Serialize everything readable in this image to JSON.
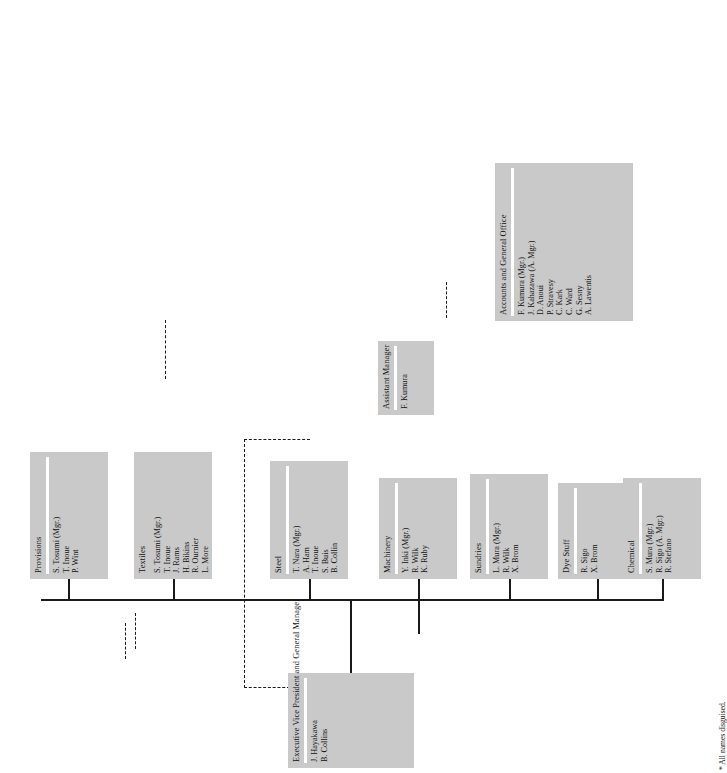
{
  "chart": {
    "type": "org-chart",
    "footnote": "* All names disguised.",
    "accent_color": "#c9c9c9",
    "line_color": "#1a1a1a"
  },
  "executive": {
    "title": "Executive Vice President and General Manager",
    "members": [
      "J. Hayakawa",
      "B. Collins"
    ]
  },
  "assistant": {
    "title": "Assistant Manager",
    "members": [
      "F. Kumura"
    ]
  },
  "accounts": {
    "title": "Accounts and General Office",
    "members": [
      "F. Kumura (Mgr.)",
      "J. Kahazawa (A. Mgr.)",
      "D. Anoui",
      "P. Stravesy",
      "C. Kark",
      "C. Ward",
      "G. Sesny",
      "A. Lawentis"
    ]
  },
  "departments": [
    {
      "name": "Provisions",
      "members": [
        "S. Tosumi (Mgr.)",
        "T. Inoue",
        "P. Wint"
      ]
    },
    {
      "name": "Textiles",
      "members": [
        "S. Tosumi (Mgr.)",
        "T. Inoue",
        "J. Rams",
        "H. Bikins",
        "R. Ournier",
        "L. More"
      ]
    },
    {
      "name": "Steel",
      "members": [
        "T. Nara (Mgr.)",
        "A. Ham",
        "T. Inoue",
        "S. Buis",
        "B. Collin"
      ]
    },
    {
      "name": "Machinery",
      "members": [
        "Y. Inki (Mgr.)",
        "R. Wilk",
        "K. Ruby"
      ]
    },
    {
      "name": "Sundries",
      "members": [
        "L. Mura (Mgr.)",
        "R. Wilk",
        "X. Brom"
      ]
    },
    {
      "name": "Dye Stuff",
      "members": [
        "R. Sigo",
        "X. Brom"
      ]
    },
    {
      "name": "Chemical",
      "members": [
        "S. Mura (Mgr.)",
        "R. Sigo (A. Mgr.)",
        "R. Stefano"
      ]
    }
  ]
}
